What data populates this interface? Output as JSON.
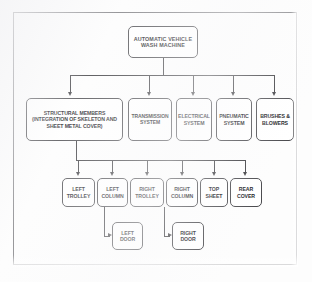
{
  "diagram": {
    "type": "hierarchical-block-diagram",
    "orientation": "top-down",
    "levels": 4,
    "frame": {
      "visible": true,
      "style": "thin-rectangle-border"
    },
    "nodes": {
      "root": {
        "id": "automatic-vehicle-wash-machine",
        "lines": [
          "AUTOMATIC VEHICLE",
          "WASH MACHINE"
        ],
        "level": 0
      },
      "structural": {
        "id": "structural-members",
        "lines": [
          "STRUCTURAL MEMBERS",
          "(INTEGRATION OF SKELETON AND",
          "SHEET METAL COVER)"
        ],
        "level": 1
      },
      "transmission": {
        "id": "transmission-system",
        "lines": [
          "TRANSMISSION",
          "SYSTEM"
        ],
        "level": 1
      },
      "electrical": {
        "id": "electrical-system",
        "lines": [
          "ELECTRICAL",
          "SYSTEM"
        ],
        "level": 1
      },
      "pneumatic": {
        "id": "pneumatic-system",
        "lines": [
          "PNEUMATIC",
          "SYSTEM"
        ],
        "level": 1
      },
      "brushes": {
        "id": "brushes-and-blowers",
        "lines": [
          "BRUSHES &",
          "BLOWERS"
        ],
        "level": 1
      },
      "left_trolley": {
        "id": "left-trolley",
        "lines": [
          "LEFT",
          "TROLLEY"
        ],
        "level": 2
      },
      "left_column": {
        "id": "left-column",
        "lines": [
          "LEFT",
          "COLUMN"
        ],
        "level": 2
      },
      "right_trolley": {
        "id": "right-trolley",
        "lines": [
          "RIGHT",
          "TROLLEY"
        ],
        "level": 2
      },
      "right_column": {
        "id": "right-column",
        "lines": [
          "RIGHT",
          "COLUMN"
        ],
        "level": 2
      },
      "top_sheet": {
        "id": "top-sheet",
        "lines": [
          "TOP",
          "SHEET"
        ],
        "level": 2
      },
      "rear_cover": {
        "id": "rear-cover",
        "lines": [
          "REAR",
          "COVER"
        ],
        "level": 2
      },
      "left_door": {
        "id": "left-door",
        "lines": [
          "LEFT",
          "DOOR"
        ],
        "level": 3
      },
      "right_door": {
        "id": "right-door",
        "lines": [
          "RIGHT",
          "DOOR"
        ],
        "level": 3
      }
    },
    "edges": [
      {
        "from": "automatic-vehicle-wash-machine",
        "to": "structural-members"
      },
      {
        "from": "automatic-vehicle-wash-machine",
        "to": "transmission-system"
      },
      {
        "from": "automatic-vehicle-wash-machine",
        "to": "electrical-system"
      },
      {
        "from": "automatic-vehicle-wash-machine",
        "to": "pneumatic-system"
      },
      {
        "from": "automatic-vehicle-wash-machine",
        "to": "brushes-and-blowers"
      },
      {
        "from": "structural-members",
        "to": "left-trolley"
      },
      {
        "from": "structural-members",
        "to": "left-column"
      },
      {
        "from": "structural-members",
        "to": "right-trolley"
      },
      {
        "from": "structural-members",
        "to": "right-column"
      },
      {
        "from": "structural-members",
        "to": "top-sheet"
      },
      {
        "from": "structural-members",
        "to": "rear-cover"
      },
      {
        "from": "left-column",
        "to": "left-door"
      },
      {
        "from": "right-column",
        "to": "right-door"
      }
    ],
    "colors": {
      "node_border": "#4a4a4e",
      "node_fill": "#ffffff",
      "connector": "#3a3a3e",
      "text": "#16161a",
      "frame": "#7e7e82",
      "background": "#fdfdfd"
    }
  }
}
